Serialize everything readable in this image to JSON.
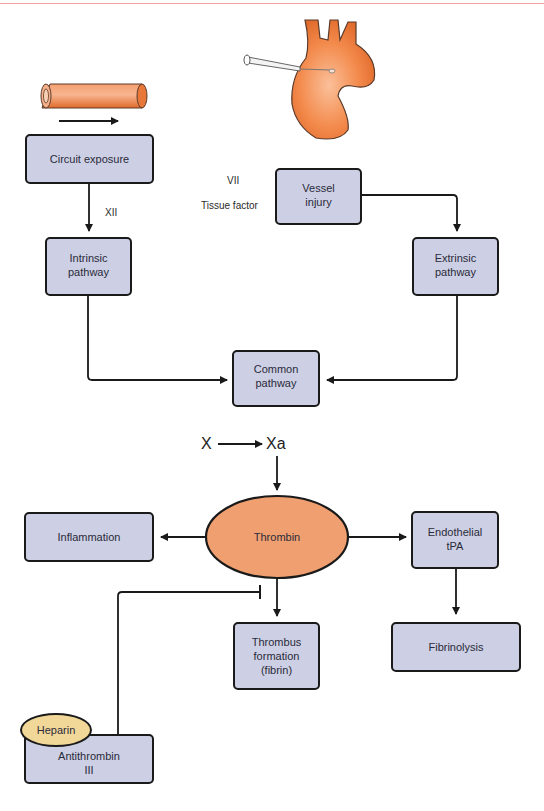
{
  "diagram": {
    "colors": {
      "box_fill": "#cdd0e4",
      "thrombin_fill": "#f0a070",
      "heparin_fill": "#f2d898",
      "vessel_orange": "#f08a4a",
      "stroke": "#1a1a1a"
    },
    "nodes": {
      "circuit_exposure": "Circuit exposure",
      "intrinsic_line1": "Intrinsic",
      "intrinsic_line2": "pathway",
      "vessel_line1": "Vessel",
      "vessel_line2": "injury",
      "extrinsic_line1": "Extrinsic",
      "extrinsic_line2": "pathway",
      "common_line1": "Common",
      "common_line2": "pathway",
      "thrombin": "Thrombin",
      "inflammation": "Inflammation",
      "endothelial_line1": "Endothelial",
      "endothelial_line2": "tPA",
      "fibrinolysis": "Fibrinolysis",
      "thrombus_line1": "Thrombus",
      "thrombus_line2": "formation",
      "thrombus_line3": "(fibrin)",
      "heparin": "Heparin",
      "antithrombin_line1": "Antithrombin",
      "antithrombin_line2": "III"
    },
    "labels": {
      "factor_xii": "XII",
      "factor_vii": "VII",
      "tissue_factor": "Tissue factor",
      "factor_x": "X",
      "factor_xa": "Xa"
    }
  }
}
